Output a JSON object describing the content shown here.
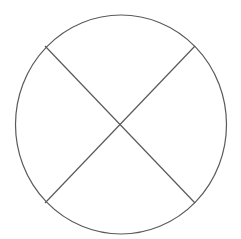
{
  "diagram": {
    "title": "",
    "background": "#ffffff",
    "stroke_color": "#5a5a5a",
    "stroke_width": 1.2,
    "shapes": {
      "circle": {
        "cx": 121,
        "cy": 124.5,
        "rx": 105.5,
        "ry": 109.5
      },
      "chords": [
        {
          "name": "diagonal-chord-tl-br",
          "x1": 45,
          "y1": 46,
          "x2": 195,
          "y2": 203
        },
        {
          "name": "diagonal-chord-tr-bl",
          "x1": 195,
          "y1": 46,
          "x2": 45,
          "y2": 203
        }
      ],
      "intersection": {
        "x": 121,
        "y": 124
      }
    },
    "labels": []
  }
}
